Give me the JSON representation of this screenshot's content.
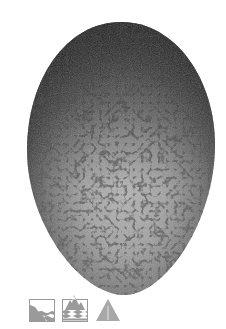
{
  "subject": {
    "label": "Speckled bird egg",
    "colors": {
      "shell_light": "#b8b8b8",
      "shell_mid": "#8a8a8a",
      "shell_dark": "#2e2e2e",
      "speckle": "#1c1c1c"
    }
  },
  "icons": [
    {
      "name": "cliff-coast-habitat-icon",
      "color": "#9a9a9a"
    },
    {
      "name": "mountain-water-habitat-icon",
      "color": "#9a9a9a"
    },
    {
      "name": "warning-triangle-icon",
      "color": "#a8a8a8"
    }
  ]
}
